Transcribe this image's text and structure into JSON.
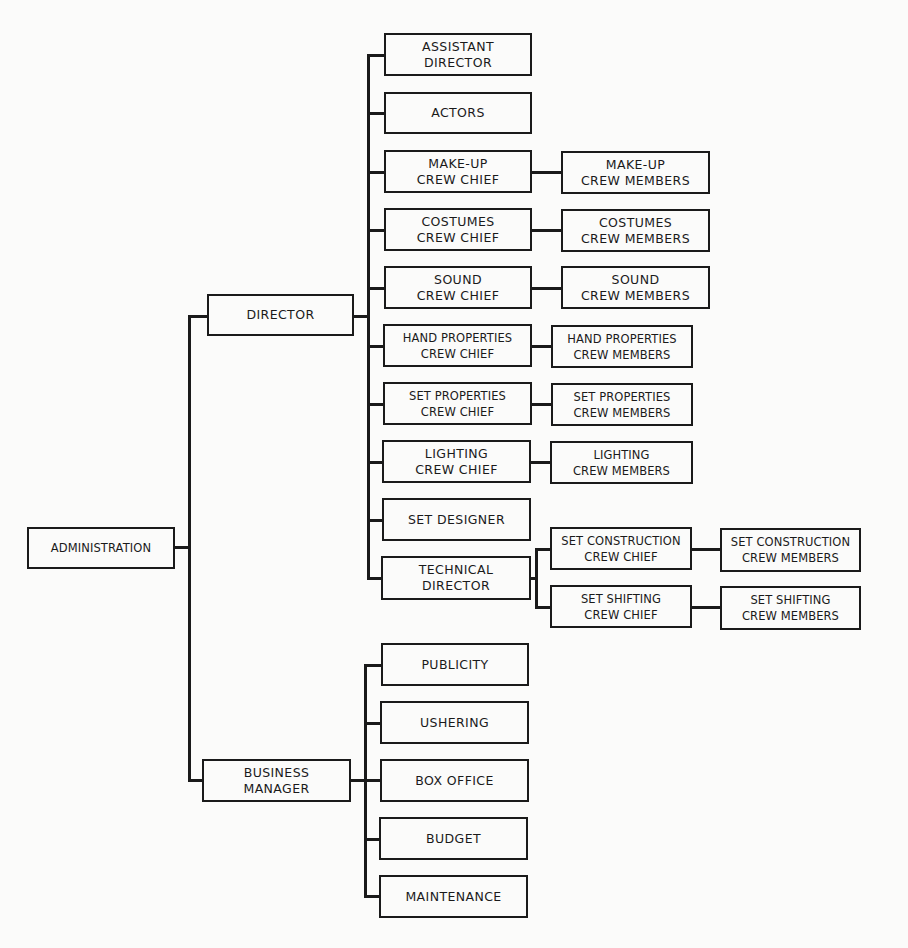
{
  "chart": {
    "root": {
      "id": "administration",
      "lines": [
        "ADMINISTRATION"
      ]
    },
    "level1": [
      {
        "id": "director",
        "lines": [
          "DIRECTOR"
        ]
      },
      {
        "id": "business-manager",
        "lines": [
          "BUSINESS",
          "MANAGER"
        ]
      }
    ],
    "director_reports": [
      {
        "id": "assistant-director",
        "lines": [
          "ASSISTANT",
          "DIRECTOR"
        ]
      },
      {
        "id": "actors",
        "lines": [
          "ACTORS"
        ]
      },
      {
        "id": "makeup-crew-chief",
        "lines": [
          "MAKE-UP",
          "CREW CHIEF"
        ],
        "members": [
          "MAKE-UP",
          "CREW MEMBERS"
        ]
      },
      {
        "id": "costumes-crew-chief",
        "lines": [
          "COSTUMES",
          "CREW CHIEF"
        ],
        "members": [
          "COSTUMES",
          "CREW MEMBERS"
        ]
      },
      {
        "id": "sound-crew-chief",
        "lines": [
          "SOUND",
          "CREW CHIEF"
        ],
        "members": [
          "SOUND",
          "CREW MEMBERS"
        ]
      },
      {
        "id": "hand-properties-crew-chief",
        "lines": [
          "HAND PROPERTIES",
          "CREW CHIEF"
        ],
        "members": [
          "HAND PROPERTIES",
          "CREW MEMBERS"
        ]
      },
      {
        "id": "set-properties-crew-chief",
        "lines": [
          "SET PROPERTIES",
          "CREW CHIEF"
        ],
        "members": [
          "SET PROPERTIES",
          "CREW MEMBERS"
        ]
      },
      {
        "id": "lighting-crew-chief",
        "lines": [
          "LIGHTING",
          "CREW CHIEF"
        ],
        "members": [
          "LIGHTING",
          "CREW MEMBERS"
        ]
      },
      {
        "id": "set-designer",
        "lines": [
          "SET DESIGNER"
        ]
      },
      {
        "id": "technical-director",
        "lines": [
          "TECHNICAL",
          "DIRECTOR"
        ]
      }
    ],
    "technical_director_reports": [
      {
        "id": "set-construction-crew-chief",
        "lines": [
          "SET CONSTRUCTION",
          "CREW CHIEF"
        ],
        "members": [
          "SET CONSTRUCTION",
          "CREW MEMBERS"
        ]
      },
      {
        "id": "set-shifting-crew-chief",
        "lines": [
          "SET SHIFTING",
          "CREW CHIEF"
        ],
        "members": [
          "SET SHIFTING",
          "CREW MEMBERS"
        ]
      }
    ],
    "business_manager_reports": [
      {
        "id": "publicity",
        "lines": [
          "PUBLICITY"
        ]
      },
      {
        "id": "ushering",
        "lines": [
          "USHERING"
        ]
      },
      {
        "id": "box-office",
        "lines": [
          "BOX OFFICE"
        ]
      },
      {
        "id": "budget",
        "lines": [
          "BUDGET"
        ]
      },
      {
        "id": "maintenance",
        "lines": [
          "MAINTENANCE"
        ]
      }
    ]
  }
}
